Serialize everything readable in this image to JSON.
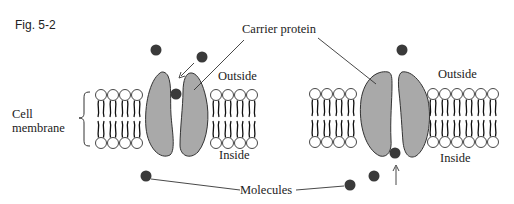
{
  "figure": {
    "number": "Fig. 5-2",
    "labels": {
      "carrier_protein": "Carrier protein",
      "outside_left": "Outside",
      "outside_right": "Outside",
      "inside_left": "Inside",
      "inside_right": "Inside",
      "cell_membrane_line1": "Cell",
      "cell_membrane_line2": "membrane",
      "molecules": "Molecules"
    },
    "colors": {
      "protein_fill": "#a9a9a9",
      "molecule_fill": "#3a3a3a",
      "line": "#333333"
    }
  }
}
